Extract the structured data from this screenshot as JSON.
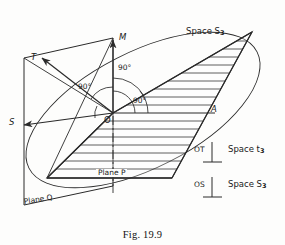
{
  "figure": {
    "caption": "Fig. 19.9",
    "ink_color": "#2a2a2a",
    "background_color": "#fdfdfc"
  },
  "labels": {
    "axis_m": "M",
    "axis_t": "T",
    "axis_s": "S",
    "origin": "O",
    "point_a": "A",
    "angle_1": "90°",
    "angle_2": "90°",
    "angle_3": "90°",
    "plane_p": "Plane P",
    "plane_q": "Plane Q",
    "space_top": "Space S",
    "space_top_sub": "3"
  },
  "legend": {
    "rows": [
      {
        "vector": "OT",
        "perp_symbol": "⊥",
        "space": "Space t",
        "space_sub": "3"
      },
      {
        "vector": "OS",
        "perp_symbol": "⊥",
        "space": "Space S",
        "space_sub": "3"
      }
    ]
  },
  "diagram_data": {
    "type": "geometric-diagram",
    "description": "Three-dimensional sketch of plane P hatched inside an ellipse, plane Q as a vertical parallelogram, with orthogonal axes OM, OT, OS meeting at origin O at 90 degrees",
    "origin": {
      "x": 113,
      "y": 113
    },
    "axes": [
      {
        "name": "OM",
        "label": "M",
        "tip": {
          "x": 113,
          "y": 37
        }
      },
      {
        "name": "OT",
        "label": "T",
        "tip": {
          "x": 40,
          "y": 57
        }
      },
      {
        "name": "OS",
        "label": "S",
        "tip": {
          "x": 22,
          "y": 125
        }
      },
      {
        "name": "OA",
        "label": "A",
        "tip": {
          "x": 210,
          "y": 113
        }
      }
    ],
    "right_angles": [
      {
        "between": "OT-OM",
        "value": 90
      },
      {
        "between": "OM-OA",
        "value": 90
      },
      {
        "between": "OA-OS",
        "value": 90
      }
    ],
    "hatch_line_count": 17
  }
}
